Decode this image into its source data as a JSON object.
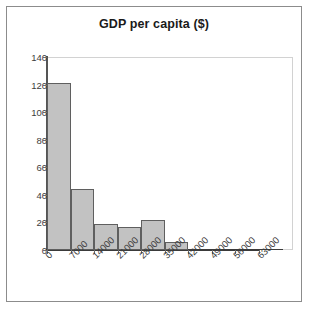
{
  "chart_data": {
    "type": "bar",
    "title": "GDP per capita ($)",
    "xlabel": "",
    "ylabel": "",
    "categories": [
      "0",
      "7000",
      "14000",
      "21000",
      "28000",
      "35000",
      "42000",
      "49000",
      "56000",
      "63000"
    ],
    "values": [
      121,
      44,
      19,
      17,
      22,
      6,
      0,
      0,
      0,
      1
    ],
    "series": [
      {
        "name": "Frequency",
        "values": [
          121,
          44,
          19,
          17,
          22,
          6,
          0,
          0,
          0,
          1
        ]
      }
    ],
    "ylim": [
      0,
      140
    ],
    "ytick_labels": [
      "0",
      "20",
      "40",
      "60",
      "80",
      "100",
      "120",
      "140"
    ],
    "ytick_values": [
      0,
      20,
      40,
      60,
      80,
      100,
      120,
      140
    ],
    "grid": false,
    "legend": false,
    "legend_position": "none",
    "bar_fill_color": "#c2c2c2",
    "bar_edge_color": "#5f5f5f",
    "axis_color": "#3a3a3a",
    "plot_border_color": "#d2d2d2",
    "frame_color": "#8c8c8c",
    "xtick_label_rotation": -45
  }
}
